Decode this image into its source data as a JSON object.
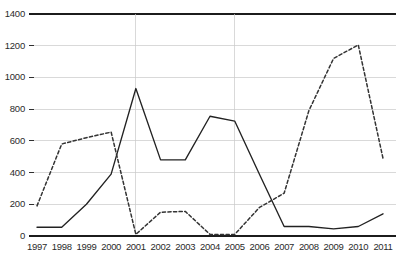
{
  "chart_data": {
    "type": "line",
    "title": "",
    "subtitle": "",
    "xlabel": "",
    "ylabel": "",
    "categories": [
      "1997",
      "1998",
      "1999",
      "2000",
      "2001",
      "2002",
      "2003",
      "2004",
      "2005",
      "2006",
      "2007",
      "2008",
      "2009",
      "2010",
      "2011"
    ],
    "x": [
      1997,
      1998,
      1999,
      2000,
      2001,
      2002,
      2003,
      2004,
      2005,
      2006,
      2007,
      2008,
      2009,
      2010,
      2011
    ],
    "ylim": [
      0,
      1400
    ],
    "yticks": [
      0,
      200,
      400,
      600,
      800,
      1000,
      1200,
      1400
    ],
    "ytick_labels": [
      "0",
      "200",
      "400",
      "600",
      "800",
      "1000",
      "1200",
      "1400"
    ],
    "grid": true,
    "grid_axis": "both",
    "legend": false,
    "legend_position": "none",
    "series": [
      {
        "name": "series-solid",
        "style": "solid",
        "color": "#222222",
        "values": [
          55,
          55,
          200,
          390,
          930,
          480,
          480,
          755,
          725,
          390,
          60,
          60,
          45,
          60,
          140
        ]
      },
      {
        "name": "series-dashed",
        "style": "dashed",
        "color": "#333333",
        "values": [
          190,
          580,
          620,
          655,
          10,
          150,
          155,
          10,
          10,
          180,
          270,
          790,
          1120,
          1205,
          490
        ]
      }
    ],
    "annotations": []
  },
  "axes": {
    "y_axis_name": "y-axis",
    "x_axis_name": "x-axis",
    "top_rule_value": 1400
  },
  "colors": {
    "grid": "#c9c9c9",
    "axis": "#1c1c1c",
    "solid_series": "#222222",
    "dashed_series": "#333333",
    "background": "#ffffff",
    "text": "#2b2b2b"
  }
}
